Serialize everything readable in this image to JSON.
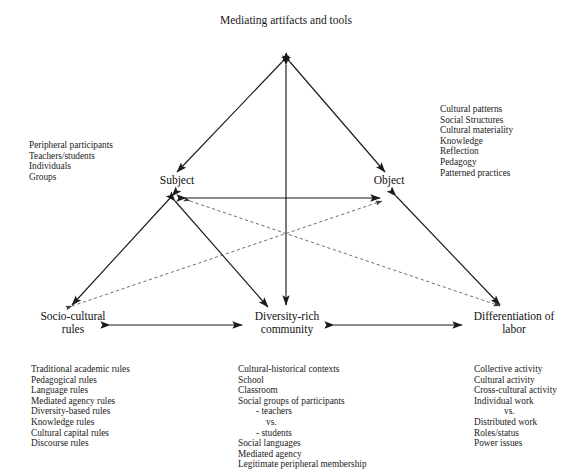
{
  "diagram": {
    "nodes": {
      "mediating": {
        "line1": "Mediating",
        "line2": "artifacts and tools"
      },
      "subject": {
        "line1": "Subject"
      },
      "object": {
        "line1": "Object"
      },
      "rules": {
        "line1": "Socio-cultural",
        "line2": "rules"
      },
      "community": {
        "line1": "Diversity-rich",
        "line2": "community"
      },
      "labor": {
        "line1": "Differentiation of",
        "line2": "labor"
      }
    },
    "annotations": {
      "subject_list": [
        "Peripheral participants",
        "Teachers/students",
        "Individuals",
        "Groups"
      ],
      "object_list": [
        "Cultural patterns",
        "Social Structures",
        "Cultural materiality",
        "Knowledge",
        "Reflection",
        "Pedagogy",
        "Patterned practices"
      ],
      "rules_list": [
        "Traditional academic rules",
        "Pedagogical rules",
        "Language rules",
        "Mediated agency rules",
        "Diversity-based rules",
        "Knowledge rules",
        "Cultural capital rules",
        "Discourse rules"
      ],
      "community_list": [
        "Cultural-historical contexts",
        "School",
        "Classroom",
        "Social groups of participants",
        "-   teachers",
        "vs.",
        "-   students",
        "Social languages",
        "Mediated agency",
        "Legitimate peripheral membership"
      ],
      "labor_list": [
        "Collective activity",
        "Cultural activity",
        "Cross-cultural activity",
        "Individual work",
        "vs.",
        "Distributed work",
        "Roles/status",
        "Power issues"
      ]
    },
    "colors": {
      "stroke": "#1a1a1a",
      "dashed_stroke": "#555555",
      "background": "#ffffff",
      "text": "#1a1a1a"
    }
  }
}
